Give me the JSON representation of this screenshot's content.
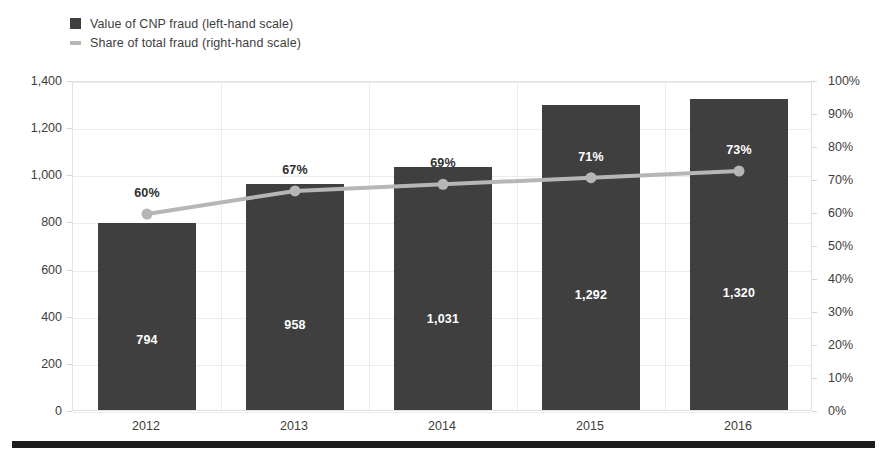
{
  "legend": {
    "items": [
      {
        "label": "Value of CNP fraud (left-hand scale)",
        "marker": "filled-square-icon",
        "color": "#3f3f3f"
      },
      {
        "label": "Share of total fraud (right-hand scale)",
        "marker": "line-segment-icon",
        "color": "#b6b6b6"
      }
    ]
  },
  "axes": {
    "left_ticks": [
      "0",
      "200",
      "400",
      "600",
      "800",
      "1,000",
      "1,200",
      "1,400"
    ],
    "right_ticks": [
      "0%",
      "10%",
      "20%",
      "30%",
      "40%",
      "50%",
      "60%",
      "70%",
      "80%",
      "90%",
      "100%"
    ],
    "x_ticks": [
      "2012",
      "2013",
      "2014",
      "2015",
      "2016"
    ]
  },
  "chart_data": {
    "type": "bar",
    "title": "",
    "subtitle": "",
    "xlabel": "",
    "ylabel": "",
    "y2label": "",
    "categories": [
      "2012",
      "2013",
      "2014",
      "2015",
      "2016"
    ],
    "grid": true,
    "legend_position": "top-left",
    "ylim": [
      0,
      1400
    ],
    "ytick_step": 200,
    "y2lim": [
      0,
      100
    ],
    "y2tick_step": 10,
    "series": [
      {
        "name": "Value of CNP fraud (left-hand scale)",
        "type": "bar",
        "axis": "left",
        "color": "#3f3f3f",
        "values": [
          794,
          958,
          1031,
          1292,
          1320
        ],
        "labels": [
          "794",
          "958",
          "1,031",
          "1,292",
          "1,320"
        ],
        "label_color": "#ffffff"
      },
      {
        "name": "Share of total fraud (right-hand scale)",
        "type": "line",
        "axis": "right",
        "color": "#b6b6b6",
        "values": [
          60,
          67,
          69,
          71,
          73
        ],
        "labels": [
          "60%",
          "67%",
          "69%",
          "71%",
          "73%"
        ],
        "label_colors": [
          "#2f2f2f",
          "#2f2f2f",
          "#2f2f2f",
          "#ffffff",
          "#ffffff"
        ]
      }
    ]
  }
}
